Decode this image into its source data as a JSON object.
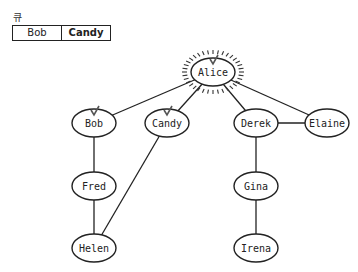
{
  "queue": {
    "label": "큐",
    "items": [
      {
        "label": "Bob",
        "active": false
      },
      {
        "label": "Candy",
        "active": true
      }
    ]
  },
  "graph": {
    "nodes": [
      {
        "id": "alice",
        "label": "Alice",
        "x": 213,
        "y": 72,
        "highlighted": true,
        "visited": true
      },
      {
        "id": "bob",
        "label": "Bob",
        "x": 94,
        "y": 123,
        "visited": true
      },
      {
        "id": "candy",
        "label": "Candy",
        "x": 167,
        "y": 123,
        "visited": true
      },
      {
        "id": "derek",
        "label": "Derek",
        "x": 256,
        "y": 123
      },
      {
        "id": "elaine",
        "label": "Elaine",
        "x": 327,
        "y": 123
      },
      {
        "id": "fred",
        "label": "Fred",
        "x": 94,
        "y": 186
      },
      {
        "id": "gina",
        "label": "Gina",
        "x": 256,
        "y": 186
      },
      {
        "id": "helen",
        "label": "Helen",
        "x": 94,
        "y": 248
      },
      {
        "id": "irena",
        "label": "Irena",
        "x": 256,
        "y": 248
      }
    ],
    "edges": [
      [
        "alice",
        "bob"
      ],
      [
        "alice",
        "candy"
      ],
      [
        "alice",
        "derek"
      ],
      [
        "alice",
        "elaine"
      ],
      [
        "derek",
        "elaine"
      ],
      [
        "bob",
        "fred"
      ],
      [
        "fred",
        "helen"
      ],
      [
        "candy",
        "helen"
      ],
      [
        "derek",
        "gina"
      ],
      [
        "gina",
        "irena"
      ]
    ]
  }
}
